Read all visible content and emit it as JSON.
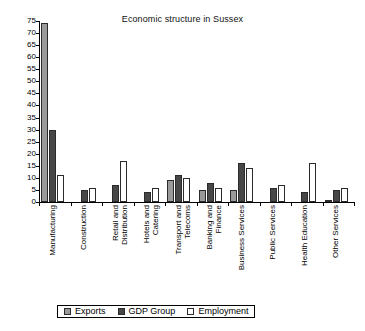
{
  "chart_data": {
    "type": "bar",
    "title": "Economic structure in Sussex",
    "xlabel": "",
    "ylabel": "",
    "ylim": [
      0,
      75
    ],
    "yticks": [
      0,
      5,
      10,
      15,
      20,
      25,
      30,
      35,
      40,
      45,
      50,
      55,
      60,
      65,
      70,
      75
    ],
    "grid": false,
    "legend_position": "bottom",
    "categories": [
      "Manufacturing",
      "Construction",
      "Retail and Distribution",
      "Hotels and Catering",
      "Transport and Telecoms",
      "Banking and Finance",
      "Business Services",
      "Public Services",
      "Health Education",
      "Other Services"
    ],
    "series": [
      {
        "name": "Exports",
        "color": "#9a9a9a",
        "values": [
          74,
          0,
          0,
          0,
          9,
          5,
          5,
          0,
          0,
          1
        ]
      },
      {
        "name": "GDP Group",
        "color": "#474747",
        "values": [
          30,
          5,
          7,
          4,
          11,
          8,
          16,
          6,
          4,
          5
        ]
      },
      {
        "name": "Employment",
        "color": "#ffffff",
        "values": [
          11,
          6,
          17,
          6,
          10,
          6,
          14,
          7,
          16,
          6
        ]
      }
    ]
  }
}
